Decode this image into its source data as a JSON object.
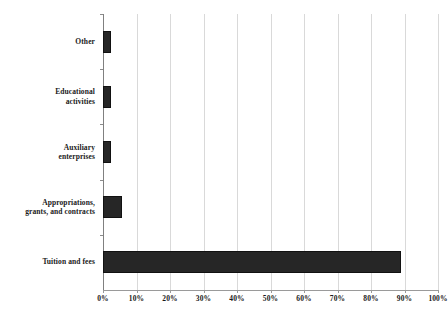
{
  "chart_data": {
    "type": "bar",
    "orientation": "horizontal",
    "title": "",
    "subtitle": "",
    "xlabel": "",
    "ylabel": "",
    "categories": [
      "Other",
      "Educational activities",
      "Auxiliary enterprises",
      "Appropriations, grants, and contracts",
      "Tuition and fees"
    ],
    "category_lines": [
      [
        "Other"
      ],
      [
        "Educational",
        "activities"
      ],
      [
        "Auxiliary",
        "enterprises"
      ],
      [
        "Appropriations,",
        "grants, and contracts"
      ],
      [
        "Tuition and fees"
      ]
    ],
    "values": [
      2.5,
      2.5,
      2.5,
      5.7,
      89.0
    ],
    "value_unit": "%",
    "xlim": [
      0,
      100
    ],
    "xticks": [
      0,
      10,
      20,
      30,
      40,
      50,
      60,
      70,
      80,
      90,
      100
    ],
    "xtick_labels": [
      "0%",
      "10%",
      "20%",
      "30%",
      "40%",
      "50%",
      "60%",
      "70%",
      "80%",
      "90%",
      "100%"
    ],
    "grid": "vertical",
    "legend": "none",
    "bar_color": "#262626",
    "grid_color": "#d9d9d9",
    "axis_color": "#9a9a9a",
    "background_color": "#ffffff"
  }
}
